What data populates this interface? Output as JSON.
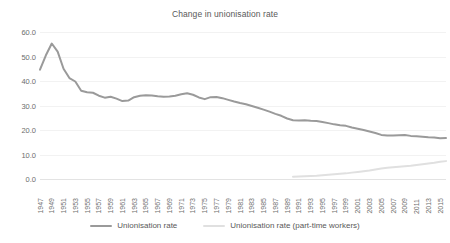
{
  "chart_data": {
    "type": "line",
    "title": "Change in unionisation rate",
    "xlabel": "",
    "ylabel": "",
    "ylim": [
      0,
      60
    ],
    "yticks": [
      0,
      10,
      20,
      30,
      40,
      50,
      60
    ],
    "ytick_labels": [
      "0.0",
      "10.0",
      "20.0",
      "30.0",
      "40.0",
      "50.0",
      "60.0"
    ],
    "grid": true,
    "legend_position": "bottom",
    "x": [
      1947,
      1948,
      1949,
      1950,
      1951,
      1952,
      1953,
      1954,
      1955,
      1956,
      1957,
      1958,
      1959,
      1960,
      1961,
      1962,
      1963,
      1964,
      1965,
      1966,
      1967,
      1968,
      1969,
      1970,
      1971,
      1972,
      1973,
      1974,
      1975,
      1976,
      1977,
      1978,
      1979,
      1980,
      1981,
      1982,
      1983,
      1984,
      1985,
      1986,
      1987,
      1988,
      1989,
      1990,
      1991,
      1992,
      1993,
      1994,
      1995,
      1996,
      1997,
      1998,
      1999,
      2000,
      2001,
      2002,
      2003,
      2004,
      2005,
      2006,
      2007,
      2008,
      2009,
      2010,
      2011,
      2012,
      2013,
      2014,
      2015,
      2016
    ],
    "xtick_labels": [
      "1947",
      "1949",
      "1951",
      "1953",
      "1955",
      "1957",
      "1959",
      "1961",
      "1963",
      "1965",
      "1967",
      "1969",
      "1971",
      "1973",
      "1975",
      "1977",
      "1979",
      "1981",
      "1983",
      "1985",
      "1987",
      "1989",
      "1991",
      "1993",
      "1995",
      "1997",
      "1999",
      "2001",
      "2003",
      "2005",
      "2007",
      "2009",
      "2011",
      "2013",
      "2015"
    ],
    "series": [
      {
        "name": "Unionisation rate",
        "color": "#9a9a9a",
        "values": [
          44.6,
          50.5,
          55.3,
          52.0,
          45.0,
          41.2,
          39.8,
          36.0,
          35.4,
          35.2,
          34.0,
          33.2,
          33.6,
          32.8,
          31.8,
          32.0,
          33.4,
          34.0,
          34.2,
          34.1,
          33.8,
          33.6,
          33.7,
          34.0,
          34.6,
          35.0,
          34.4,
          33.3,
          32.6,
          33.4,
          33.5,
          33.0,
          32.3,
          31.6,
          31.0,
          30.5,
          29.8,
          29.1,
          28.3,
          27.5,
          26.6,
          25.8,
          24.7,
          24.0,
          23.9,
          24.0,
          23.8,
          23.7,
          23.3,
          22.8,
          22.3,
          21.9,
          21.7,
          21.0,
          20.5,
          20.0,
          19.4,
          18.8,
          18.0,
          17.8,
          17.8,
          17.9,
          18.0,
          17.6,
          17.4,
          17.2,
          17.0,
          16.9,
          16.6,
          16.7
        ]
      },
      {
        "name": "Unionisation rate (part-time workers)",
        "color": "#e0e0e0",
        "values": [
          null,
          null,
          null,
          null,
          null,
          null,
          null,
          null,
          null,
          null,
          null,
          null,
          null,
          null,
          null,
          null,
          null,
          null,
          null,
          null,
          null,
          null,
          null,
          null,
          null,
          null,
          null,
          null,
          null,
          null,
          null,
          null,
          null,
          null,
          null,
          null,
          null,
          null,
          null,
          null,
          null,
          null,
          null,
          0.9,
          1.0,
          1.1,
          1.2,
          1.3,
          1.5,
          1.7,
          1.9,
          2.1,
          2.3,
          2.6,
          2.9,
          3.2,
          3.5,
          3.9,
          4.3,
          4.6,
          4.8,
          5.0,
          5.2,
          5.4,
          5.7,
          6.0,
          6.3,
          6.6,
          7.0,
          7.3
        ]
      }
    ]
  },
  "legend": {
    "items": [
      {
        "label": "Unionisation rate",
        "color": "#9a9a9a"
      },
      {
        "label": "Unionisation rate (part-time workers)",
        "color": "#e0e0e0"
      }
    ]
  }
}
